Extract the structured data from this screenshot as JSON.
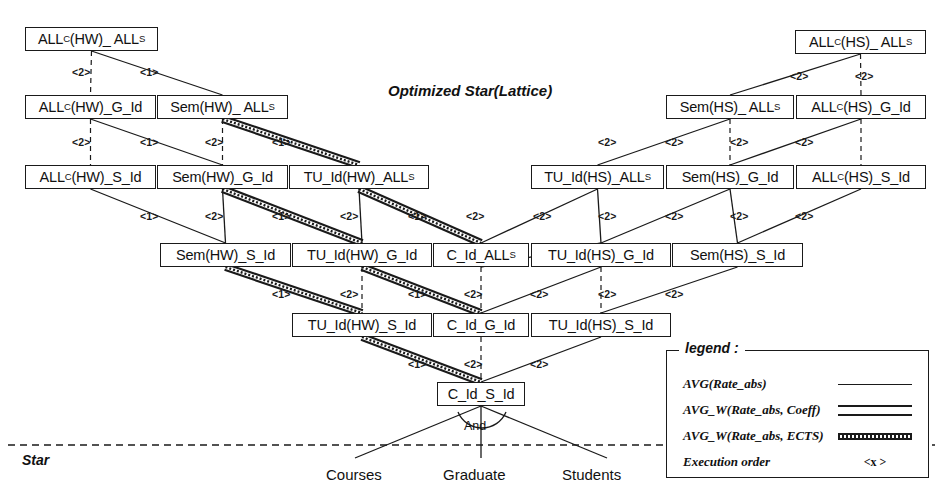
{
  "diagram": {
    "title": "Optimized Star(Lattice)",
    "star_label": "Star",
    "and_label": "And"
  },
  "nodes": [
    {
      "id": "n0",
      "label": "ALL<sup>C</sup>(HW)_ ALL<sup>S</sup>",
      "text": "ALLC(HW)_ ALLS",
      "x": 25,
      "y": 27,
      "w": 133,
      "h": 24
    },
    {
      "id": "n1",
      "label": "ALL<sup>C</sup>(HW)_G_Id",
      "text": "ALLC(HW)_G_Id",
      "x": 25,
      "y": 95,
      "w": 131,
      "h": 24
    },
    {
      "id": "n2",
      "label": "Sem(HW)_ ALL<sup>S</sup>",
      "text": "Sem(HW)_ ALLS",
      "x": 157,
      "y": 95,
      "w": 131,
      "h": 24
    },
    {
      "id": "n3",
      "label": "ALL<sup>C</sup>(HW)_S_Id",
      "text": "ALLC(HW)_S_Id",
      "x": 25,
      "y": 165,
      "w": 131,
      "h": 24
    },
    {
      "id": "n4",
      "label": "Sem(HW)_G_Id",
      "text": "Sem(HW)_G_Id",
      "x": 157,
      "y": 165,
      "w": 131,
      "h": 24
    },
    {
      "id": "n5",
      "label": "TU_Id(HW)_ALL<sup>S</sup>",
      "text": "TU_Id(HW)_ALLS",
      "x": 289,
      "y": 165,
      "w": 140,
      "h": 24
    },
    {
      "id": "n6",
      "label": "Sem(HW)_S_Id",
      "text": "Sem(HW)_S_Id",
      "x": 160,
      "y": 243,
      "w": 131,
      "h": 24
    },
    {
      "id": "n7",
      "label": "TU_Id(HW)_G_Id",
      "text": "TU_Id(HW)_G_Id",
      "x": 292,
      "y": 243,
      "w": 140,
      "h": 24
    },
    {
      "id": "n8",
      "label": "C_Id_ALL<sup>S</sup>",
      "text": "C_Id_ALLS",
      "x": 433,
      "y": 243,
      "w": 96,
      "h": 24
    },
    {
      "id": "n9",
      "label": "TU_Id(HS)_G_Id",
      "text": "TU_Id(HS)_G_Id",
      "x": 531,
      "y": 243,
      "w": 140,
      "h": 24
    },
    {
      "id": "n10",
      "label": "Sem(HS)_S_Id",
      "text": "Sem(HS)_S_Id",
      "x": 672,
      "y": 243,
      "w": 131,
      "h": 24
    },
    {
      "id": "n11",
      "label": "TU_Id(HW)_S_Id",
      "text": "TU_Id(HW)_S_Id",
      "x": 292,
      "y": 313,
      "w": 140,
      "h": 24
    },
    {
      "id": "n12",
      "label": "C_Id_G_Id",
      "text": "C_Id_G_Id",
      "x": 433,
      "y": 313,
      "w": 96,
      "h": 24
    },
    {
      "id": "n13",
      "label": "TU_Id(HS)_S_Id",
      "text": "TU_Id(HS)_S_Id",
      "x": 531,
      "y": 313,
      "w": 140,
      "h": 24
    },
    {
      "id": "n14",
      "label": "C_Id_S_Id",
      "text": "C_Id_S_Id",
      "x": 437,
      "y": 382,
      "w": 88,
      "h": 24
    },
    {
      "id": "n15",
      "label": "ALL<sup>C</sup>(HS)_ ALL<sup>S</sup>",
      "text": "ALLC(HS)_ ALLS",
      "x": 795,
      "y": 30,
      "w": 131,
      "h": 24
    },
    {
      "id": "n16",
      "label": "Sem(HS)_ ALL<sup>S</sup>",
      "text": "Sem(HS)_ ALLS",
      "x": 666,
      "y": 95,
      "w": 128,
      "h": 24
    },
    {
      "id": "n17",
      "label": "ALL<sup>C</sup>(HS)_G_Id",
      "text": "ALLC(HS)_G_Id",
      "x": 796,
      "y": 95,
      "w": 130,
      "h": 24
    },
    {
      "id": "n18",
      "label": "TU_Id(HS)_ALL<sup>S</sup>",
      "text": "TU_Id(HS)_ALLS",
      "x": 531,
      "y": 165,
      "w": 133,
      "h": 24
    },
    {
      "id": "n19",
      "label": "Sem(HS)_G_Id",
      "text": "Sem(HS)_G_Id",
      "x": 666,
      "y": 165,
      "w": 128,
      "h": 24
    },
    {
      "id": "n20",
      "label": "ALL<sup>C</sup>(HS)_S_Id",
      "text": "ALLC(HS)_S_Id",
      "x": 796,
      "y": 165,
      "w": 130,
      "h": 24
    }
  ],
  "edges": [
    {
      "from": "n0",
      "to": "n1",
      "style": "thin",
      "order": "<2>",
      "lx": 72,
      "ly": 66
    },
    {
      "from": "n0",
      "to": "n2",
      "style": "thin",
      "order": "<1>",
      "lx": 140,
      "ly": 66
    },
    {
      "from": "n1",
      "to": "n3",
      "style": "thin",
      "order": "<2>",
      "lx": 72,
      "ly": 136
    },
    {
      "from": "n1",
      "to": "n4",
      "style": "thin",
      "order": "<1>",
      "lx": 140,
      "ly": 136
    },
    {
      "from": "n2",
      "to": "n4",
      "style": "thin",
      "order": "<2>",
      "lx": 205,
      "ly": 136
    },
    {
      "from": "n2",
      "to": "n5",
      "style": "ects",
      "order": "<1>",
      "lx": 272,
      "ly": 136
    },
    {
      "from": "n3",
      "to": "n6",
      "style": "thin",
      "order": "<1>",
      "lx": 140,
      "ly": 210
    },
    {
      "from": "n4",
      "to": "n6",
      "style": "thin",
      "order": "<2>",
      "lx": 205,
      "ly": 210
    },
    {
      "from": "n4",
      "to": "n7",
      "style": "ects",
      "order": "<1>",
      "lx": 272,
      "ly": 210
    },
    {
      "from": "n5",
      "to": "n7",
      "style": "thin",
      "order": "<2>",
      "lx": 340,
      "ly": 210
    },
    {
      "from": "n5",
      "to": "n8",
      "style": "ects",
      "order": "<1>",
      "lx": 408,
      "ly": 210
    },
    {
      "from": "n6",
      "to": "n11",
      "style": "ects",
      "order": "<1>",
      "lx": 272,
      "ly": 288
    },
    {
      "from": "n7",
      "to": "n11",
      "style": "thin",
      "order": "<2>",
      "lx": 340,
      "ly": 288
    },
    {
      "from": "n7",
      "to": "n12",
      "style": "ects",
      "order": "<1>",
      "lx": 408,
      "ly": 288
    },
    {
      "from": "n8",
      "to": "n12",
      "style": "thin",
      "order": "<2>",
      "lx": 464,
      "ly": 288
    },
    {
      "from": "n8",
      "to": "n9",
      "style": "thin",
      "order": "<2>",
      "lx": 466,
      "ly": 210
    },
    {
      "from": "n11",
      "to": "n14",
      "style": "ects",
      "order": "<1>",
      "lx": 408,
      "ly": 358
    },
    {
      "from": "n12",
      "to": "n14",
      "style": "thin",
      "order": "<2>",
      "lx": 464,
      "ly": 358
    },
    {
      "from": "n13",
      "to": "n14",
      "style": "thin",
      "order": "<2>",
      "lx": 530,
      "ly": 358
    },
    {
      "from": "n9",
      "to": "n12",
      "style": "thin",
      "order": "<2>",
      "lx": 530,
      "ly": 288
    },
    {
      "from": "n9",
      "to": "n13",
      "style": "thin",
      "order": "<2>",
      "lx": 598,
      "ly": 288
    },
    {
      "from": "n10",
      "to": "n13",
      "style": "thin",
      "order": "<2>",
      "lx": 665,
      "ly": 288
    },
    {
      "from": "n15",
      "to": "n16",
      "style": "thin",
      "order": "<2>",
      "lx": 790,
      "ly": 70
    },
    {
      "from": "n15",
      "to": "n17",
      "style": "thin",
      "order": "<2>",
      "lx": 855,
      "ly": 70
    },
    {
      "from": "n16",
      "to": "n18",
      "style": "thin",
      "order": "<2>",
      "lx": 598,
      "ly": 136
    },
    {
      "from": "n16",
      "to": "n19",
      "style": "thin",
      "order": "<2>",
      "lx": 665,
      "ly": 136
    },
    {
      "from": "n17",
      "to": "n19",
      "style": "thin",
      "order": "<2>",
      "lx": 730,
      "ly": 136
    },
    {
      "from": "n17",
      "to": "n20",
      "style": "thin",
      "order": "<2>",
      "lx": 795,
      "ly": 136
    },
    {
      "from": "n18",
      "to": "n9",
      "style": "thin",
      "order": "<2>",
      "lx": 598,
      "ly": 210
    },
    {
      "from": "n19",
      "to": "n9",
      "style": "thin",
      "order": "<2>",
      "lx": 665,
      "ly": 210
    },
    {
      "from": "n19",
      "to": "n10",
      "style": "thin",
      "order": "<2>",
      "lx": 730,
      "ly": 210
    },
    {
      "from": "n20",
      "to": "n10",
      "style": "thin",
      "order": "<2>",
      "lx": 795,
      "ly": 210
    },
    {
      "from": "n18",
      "to": "n8",
      "style": "thin",
      "order": "<2>",
      "lx": 533,
      "ly": 210
    }
  ],
  "leaves": [
    {
      "label": "Courses",
      "x": 326,
      "y": 466
    },
    {
      "label": "Graduate",
      "x": 443,
      "y": 466
    },
    {
      "label": "Students",
      "x": 562,
      "y": 466
    }
  ],
  "legend": {
    "title": "legend :",
    "rows": [
      {
        "label": "AVG(Rate_abs)",
        "sample": "thin-line"
      },
      {
        "label": "AVG_W(Rate_abs, Coeff)",
        "sample": "double-line"
      },
      {
        "label": "AVG_W(Rate_abs, ECTS)",
        "sample": "hatched-line"
      },
      {
        "label": "Execution order",
        "sample": "<x >"
      }
    ]
  },
  "colors": {
    "ink": "#1a1a1a",
    "paper": "#ffffff"
  }
}
